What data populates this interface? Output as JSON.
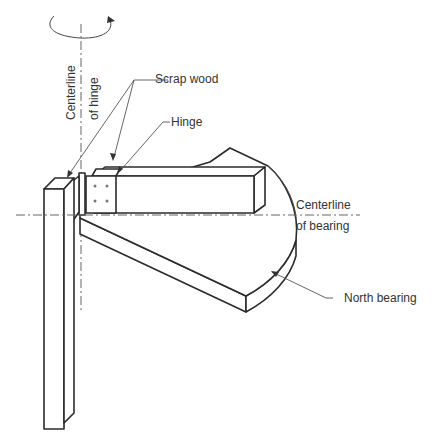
{
  "diagram": {
    "type": "isometric-technical-drawing",
    "labels": {
      "centerline_hinge_1": "Centerline",
      "centerline_hinge_2": "of hinge",
      "scrap_wood": "Scrap wood",
      "hinge": "Hinge",
      "centerline_bearing_1": "Centerline",
      "centerline_bearing_2": "of bearing",
      "north_bearing": "North bearing"
    },
    "components": [
      "vertical-post",
      "hinge-plate",
      "scrap-wood-block",
      "horizontal-arm",
      "north-bearing-slab",
      "rotation-arrow"
    ],
    "colors": {
      "line": "#2b2b2b",
      "text": "#333333",
      "background": "#ffffff"
    }
  }
}
